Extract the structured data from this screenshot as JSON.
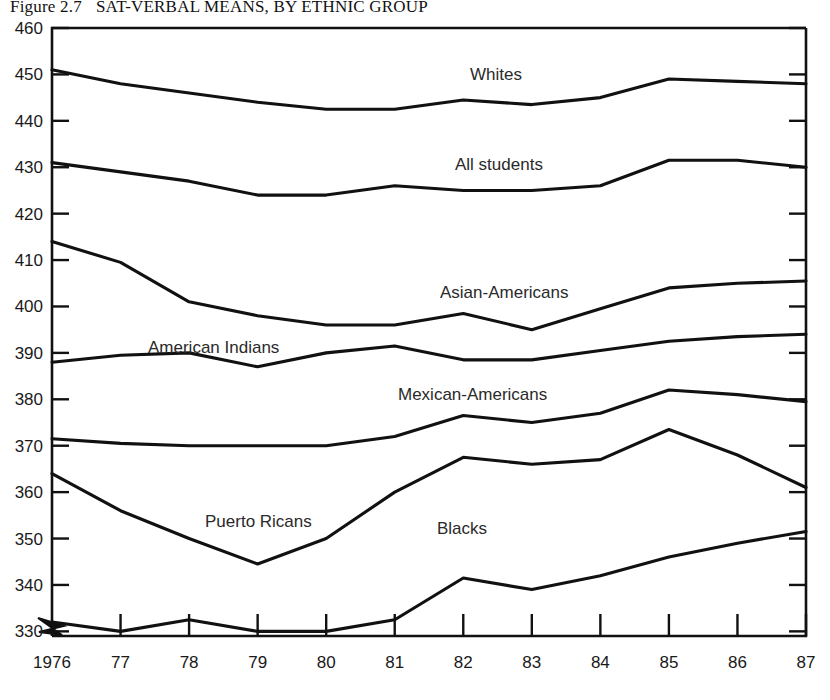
{
  "figure": {
    "number": "Figure 2.7",
    "title": "SAT-VERBAL MEANS, BY ETHNIC GROUP"
  },
  "axes": {
    "y_ticks": [
      "330",
      "340",
      "350",
      "360",
      "370",
      "380",
      "390",
      "400",
      "410",
      "420",
      "430",
      "440",
      "450",
      "460"
    ],
    "x_ticks": [
      "1976",
      "77",
      "78",
      "79",
      "80",
      "81",
      "82",
      "83",
      "84",
      "85",
      "86",
      "87"
    ]
  },
  "series_labels": {
    "whites": "Whites",
    "all_students": "All students",
    "asian_americans": "Asian-Americans",
    "american_indians": "American Indians",
    "mexican_americans": "Mexican-Americans",
    "puerto_ricans": "Puerto Ricans",
    "blacks": "Blacks"
  },
  "chart_data": {
    "type": "line",
    "title": "SAT-VERBAL MEANS, BY ETHNIC GROUP",
    "xlabel": "",
    "ylabel": "",
    "xlim": [
      1976,
      1987
    ],
    "ylim": [
      330,
      460
    ],
    "grid": false,
    "legend": "inline-labels",
    "x": [
      1976,
      1977,
      1978,
      1979,
      1980,
      1981,
      1982,
      1983,
      1984,
      1985,
      1986,
      1987
    ],
    "categories": [
      "1976",
      "77",
      "78",
      "79",
      "80",
      "81",
      "82",
      "83",
      "84",
      "85",
      "86",
      "87"
    ],
    "series": [
      {
        "name": "Whites",
        "values": [
          451,
          448,
          446,
          444,
          442.5,
          442.5,
          444.5,
          443.5,
          445,
          449,
          448.5,
          448
        ]
      },
      {
        "name": "All students",
        "values": [
          431,
          429,
          427,
          424,
          424,
          426,
          425,
          425,
          426,
          431.5,
          431.5,
          430
        ]
      },
      {
        "name": "Asian-Americans",
        "values": [
          414,
          409.5,
          401,
          398,
          396,
          396,
          398.5,
          395,
          399.5,
          404,
          405,
          405.5
        ]
      },
      {
        "name": "American Indians",
        "values": [
          388,
          389.5,
          390,
          387,
          390,
          391.5,
          388.5,
          388.5,
          390.5,
          392.5,
          393.5,
          394
        ]
      },
      {
        "name": "Mexican-Americans",
        "values": [
          371.5,
          370.5,
          370,
          370,
          370,
          372,
          376.5,
          375,
          377,
          382,
          381,
          379.5
        ]
      },
      {
        "name": "Puerto Ricans",
        "values": [
          364,
          356,
          350,
          344.5,
          350,
          360,
          367.5,
          366,
          367,
          373.5,
          368,
          361
        ]
      },
      {
        "name": "Blacks",
        "values": [
          332,
          330,
          332.5,
          330,
          330,
          332.5,
          341.5,
          339,
          342,
          346,
          349,
          351.5
        ]
      }
    ]
  }
}
